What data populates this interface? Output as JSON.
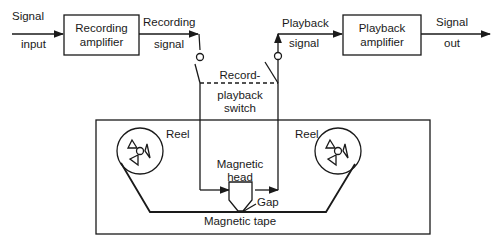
{
  "diagram": {
    "type": "tape-recorder block diagram",
    "blocks": {
      "recording_amplifier": "Recording\namplifier",
      "recording_amplifier_l1": "Recording",
      "recording_amplifier_l2": "amplifier",
      "playback_amplifier_l1": "Playback",
      "playback_amplifier_l2": "amplifier"
    },
    "labels": {
      "signal_input_l1": "Signal",
      "signal_input_l2": "input",
      "recording_signal_l1": "Recording",
      "recording_signal_l2": "signal",
      "playback_signal_l1": "Playback",
      "playback_signal_l2": "signal",
      "signal_out_l1": "Signal",
      "signal_out_l2": "out",
      "switch_l1": "Record-",
      "switch_l2": "playback",
      "switch_l3": "switch",
      "reel_left": "Reel",
      "reel_right": "Reel",
      "head_l1": "Magnetic",
      "head_l2": "head",
      "gap": "Gap",
      "tape": "Magnetic tape"
    },
    "colors": {
      "line": "#1a1a1a",
      "background": "#ffffff"
    }
  }
}
